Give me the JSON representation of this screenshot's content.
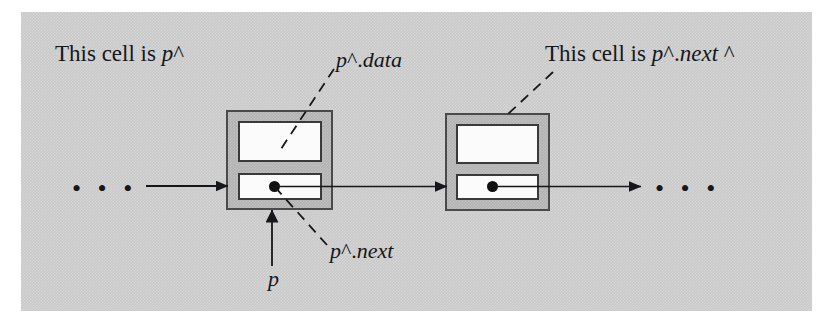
{
  "figure": {
    "type": "linked-list-pointer-diagram",
    "background_color": "#c9c9c9",
    "cell_fill_color": "#b2b2b2",
    "field_fill_color": "#fbfbfb",
    "line_color": "#16171a",
    "labels": {
      "left_cell_caption_prefix": "This cell is ",
      "left_cell_caption_var": "p",
      "left_cell_caption_suffix": "^",
      "right_cell_caption_prefix": "This cell is ",
      "right_cell_caption_var": "p",
      "right_cell_caption_mid": "^.",
      "right_cell_caption_field": "next",
      "right_cell_caption_suffix": " ^",
      "data_label_var": "p",
      "data_label_sep": "^.",
      "data_label_field": "data",
      "next_label_var": "p",
      "next_label_sep": "^.",
      "next_label_field": "next",
      "pointer_label": "p",
      "left_ellipsis": "• • •",
      "right_ellipsis": "• • •"
    },
    "cells": [
      {
        "name": "first-cell",
        "data_field_label": "",
        "next_field_label": "",
        "has_next_pointer_dot": true
      },
      {
        "name": "second-cell",
        "data_field_label": "",
        "next_field_label": "",
        "has_next_pointer_dot": true
      }
    ]
  }
}
